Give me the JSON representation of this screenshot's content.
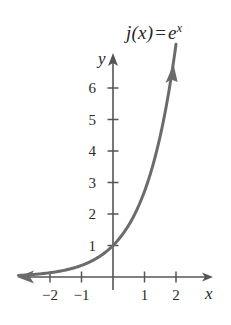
{
  "figure": {
    "title_parts": {
      "fn": "j(x)",
      "eq": "=",
      "base": "e",
      "exponent": "x"
    },
    "axis_names": {
      "x": "x",
      "y": "y"
    },
    "colors": {
      "curve": "#6b6b6b",
      "axis": "#555555",
      "text": "#262626",
      "background": "#ffffff"
    }
  },
  "chart_data": {
    "type": "line",
    "xlabel": "x",
    "ylabel": "y",
    "xlim": [
      -3,
      3.1
    ],
    "ylim": [
      -0.45,
      7.2
    ],
    "grid": false,
    "legend": null,
    "annotations": [
      {
        "text": "j(x) = e^x",
        "x": 1.4,
        "y": 7.0
      }
    ],
    "xticks": [
      -2,
      -1,
      1,
      2
    ],
    "xtick_labels": [
      "−2",
      "−1",
      "1",
      "2"
    ],
    "yticks": [
      1,
      2,
      3,
      4,
      5,
      6
    ],
    "ytick_labels": [
      "1",
      "2",
      "3",
      "4",
      "5",
      "6"
    ],
    "series": [
      {
        "name": "j(x) = e^x",
        "equation": "y = e^x",
        "color": "#6b6b6b",
        "arrow_end": "both",
        "x": [
          -3.0,
          -2.5,
          -2.0,
          -1.5,
          -1.0,
          -0.5,
          0.0,
          0.5,
          1.0,
          1.5,
          1.8,
          2.0
        ],
        "values": [
          0.05,
          0.08,
          0.14,
          0.22,
          0.37,
          0.61,
          1.0,
          1.65,
          2.72,
          4.48,
          6.05,
          7.39
        ]
      }
    ]
  }
}
